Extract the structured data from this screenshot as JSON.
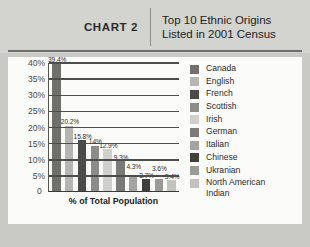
{
  "header": {
    "chart_label": "CHART 2",
    "title_line1": "Top 10 Ethnic Origins",
    "title_line2": "Listed in 2001 Census"
  },
  "chart_data": {
    "type": "bar",
    "title": "Top 10 Ethnic Origins Listed in 2001 Census",
    "xlabel": "% of Total Population",
    "ylabel": "",
    "ylim": [
      0,
      40
    ],
    "grid": true,
    "legend_position": "right",
    "categories": [
      "Canada",
      "English",
      "French",
      "Scottish",
      "Irish",
      "German",
      "Italian",
      "Chinese",
      "Ukranian",
      "North American Indian"
    ],
    "values": [
      39.4,
      20.2,
      15.8,
      14,
      12.9,
      9.3,
      4.3,
      3.7,
      3.6,
      3.4
    ],
    "value_labels": [
      "39.4%",
      "20.2%",
      "15.8%",
      "14%",
      "12.9%",
      "9.3%",
      "4.3%",
      "3.7%",
      "3.6%",
      "3.4%"
    ],
    "ytick_labels": [
      "40%",
      "35%",
      "30%",
      "25%",
      "20%",
      "15%",
      "10%",
      "5%",
      "0"
    ],
    "ytick_values": [
      40,
      35,
      30,
      25,
      20,
      15,
      10,
      5,
      0
    ],
    "colors": [
      "#6f6f6b",
      "#b5b5b1",
      "#4a4a46",
      "#8c8c88",
      "#cfcfcb",
      "#7a7a76",
      "#a3a39f",
      "#3f3f3b",
      "#9a9a96",
      "#c2c2be"
    ]
  },
  "legend": {
    "items": [
      {
        "label": "Canada",
        "color": "#6f6f6b"
      },
      {
        "label": "English",
        "color": "#b5b5b1"
      },
      {
        "label": "French",
        "color": "#4a4a46"
      },
      {
        "label": "Scottish",
        "color": "#8c8c88"
      },
      {
        "label": "Irish",
        "color": "#cfcfcb"
      },
      {
        "label": "German",
        "color": "#7a7a76"
      },
      {
        "label": "Italian",
        "color": "#a3a39f"
      },
      {
        "label": "Chinese",
        "color": "#3f3f3b"
      },
      {
        "label": "Ukranian",
        "color": "#9a9a96"
      },
      {
        "label": "North American\nIndian",
        "color": "#c2c2be"
      }
    ]
  }
}
